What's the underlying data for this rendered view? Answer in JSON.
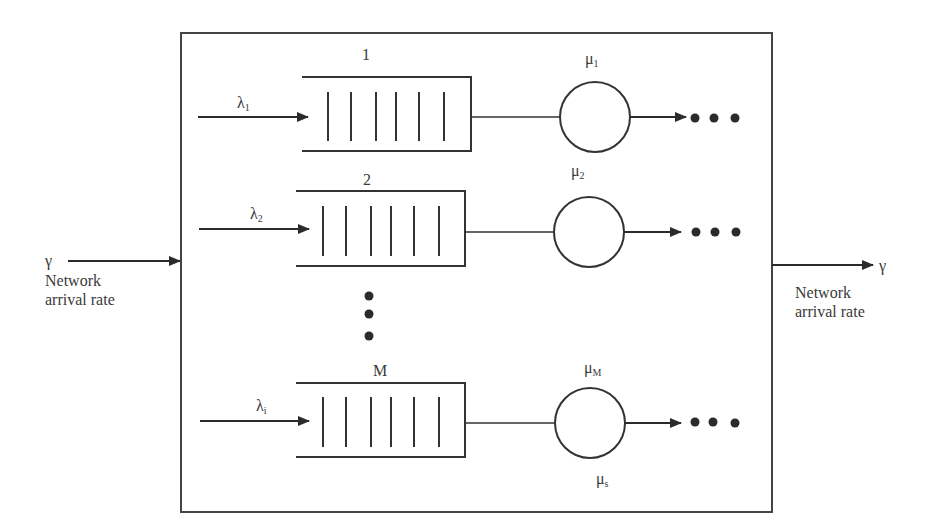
{
  "diagram": {
    "type": "queueing-network",
    "input": {
      "symbol": "γ",
      "label_line1": "Network",
      "label_line2": "arrival rate"
    },
    "output": {
      "symbol": "γ",
      "label_line1": "Network",
      "label_line2": "arrival rate"
    },
    "rows": [
      {
        "queue_label": "1",
        "arrival_symbol": "λ",
        "arrival_sub": "1",
        "server_symbol": "μ",
        "server_sub": "1",
        "bars": 6
      },
      {
        "queue_label": "2",
        "arrival_symbol": "λ",
        "arrival_sub": "2",
        "server_symbol": "μ",
        "server_sub": "2",
        "bars": 6
      },
      {
        "queue_label": "M",
        "arrival_symbol": "λ",
        "arrival_sub": "i",
        "server_symbol": "μ",
        "server_sub": "M",
        "bars": 6,
        "below_server_symbol": "μ",
        "below_server_sub": "s"
      }
    ],
    "ellipsis_vertical": "⋮",
    "colors": {
      "line": "#333333",
      "text": "#3a3a3a",
      "background": "#ffffff"
    }
  }
}
